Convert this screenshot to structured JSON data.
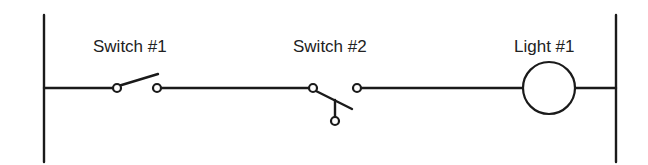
{
  "diagram": {
    "type": "ladder-logic",
    "colors": {
      "stroke": "#1a1a1a",
      "text": "#222222",
      "background": "#ffffff"
    },
    "rails": {
      "left": {
        "x": 44,
        "y1": 15,
        "y2": 162
      },
      "right": {
        "x": 616,
        "y1": 15,
        "y2": 162
      }
    },
    "rung_y": 88,
    "components": [
      {
        "id": "switch1",
        "label": "Switch #1",
        "kind": "normally-open switch (SPST)"
      },
      {
        "id": "switch2",
        "label": "Switch #2",
        "kind": "single-pole double-throw switch"
      },
      {
        "id": "light1",
        "label": "Light #1",
        "kind": "light / lamp"
      }
    ]
  }
}
